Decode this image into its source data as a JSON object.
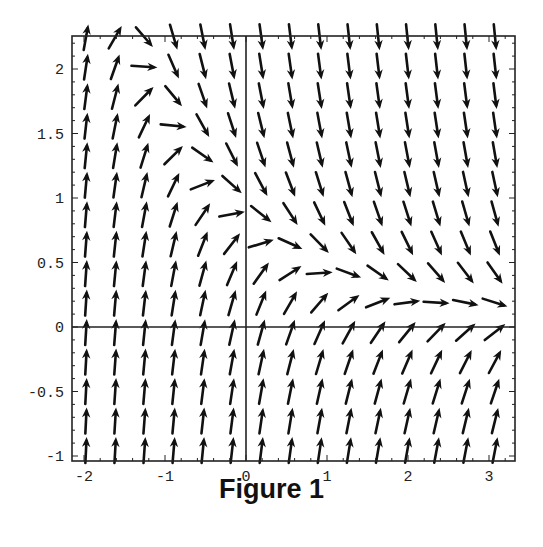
{
  "figure": {
    "caption": "Figure 1"
  },
  "chart_data": {
    "type": "direction_field",
    "title": "",
    "caption": "Figure 1",
    "xlabel": "",
    "ylabel": "",
    "xlim": [
      -2.15,
      3.33
    ],
    "ylim": [
      -1.05,
      2.25
    ],
    "x_ticks": [
      -2,
      -1,
      0,
      1,
      2,
      3
    ],
    "x_tick_labels": [
      "-2",
      "-1",
      "0",
      "1",
      "2",
      "3"
    ],
    "y_ticks": [
      -1,
      -0.5,
      0,
      0.5,
      1,
      1.5,
      2
    ],
    "y_tick_labels": [
      "-1",
      "-0.5",
      "0",
      "0.5",
      "1",
      "1.5",
      "2"
    ],
    "axes_lines": {
      "x_axis_at_y": 0,
      "y_axis_at_x": 0
    },
    "grid": false,
    "frame": true,
    "arrow_grid": {
      "x_start": -2.0,
      "x_end": 3.05,
      "columns": 15,
      "y_start": -1.0,
      "y_end": 2.2,
      "rows": 15
    },
    "slope_field_model": "dy/dx = 3*(0.75*exp(-0.75x) - y)",
    "zero_slope_isocline_samples": [
      {
        "x": -1.2,
        "y": 1.8
      },
      {
        "x": -0.8,
        "y": 1.35
      },
      {
        "x": -0.45,
        "y": 0.95
      },
      {
        "x": 0.0,
        "y": 0.75
      },
      {
        "x": 0.3,
        "y": 0.5
      },
      {
        "x": 0.65,
        "y": 0.3
      },
      {
        "x": 3.0,
        "y": 0.05
      }
    ],
    "arrow_color": "#111111",
    "frame_color": "#222222"
  },
  "layout": {
    "frame_px": {
      "left": 72,
      "top": 36,
      "right": 515,
      "bottom": 461
    },
    "x0_px": 246,
    "x_unit_px": 81,
    "y0_px": 327,
    "y_unit_px": 129
  }
}
